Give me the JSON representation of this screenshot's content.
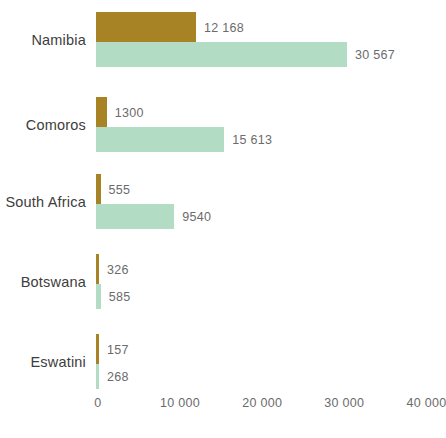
{
  "chart_data": {
    "type": "bar",
    "orientation": "horizontal",
    "title": "",
    "subtitle": "",
    "xlabel": "",
    "ylabel": "",
    "categories": [
      "Namibia",
      "Comoros",
      "South Africa",
      "Botswana",
      "Eswatini"
    ],
    "series": [
      {
        "name": "gold",
        "color": "#a88326",
        "values": [
          12168,
          1300,
          555,
          326,
          157
        ],
        "labels": [
          "12 168",
          "1300",
          "555",
          "326",
          "157"
        ]
      },
      {
        "name": "green",
        "color": "#b2dcc3",
        "values": [
          30567,
          15613,
          9540,
          585,
          268
        ],
        "labels": [
          "30 567",
          "15 613",
          "9540",
          "585",
          "268"
        ]
      }
    ],
    "xlim": [
      0,
      40000
    ],
    "xticks": [
      0,
      10000,
      20000,
      30000,
      40000
    ],
    "xtick_labels": [
      "0",
      "10 000",
      "20 000",
      "30 000",
      "40 000"
    ],
    "grid": false,
    "legend": "none"
  },
  "colors": {
    "gold": "#a88326",
    "green": "#b2dcc3",
    "label_text": "#3d3d3d",
    "value_text": "#6b6b6b",
    "background": "#ffffff"
  }
}
